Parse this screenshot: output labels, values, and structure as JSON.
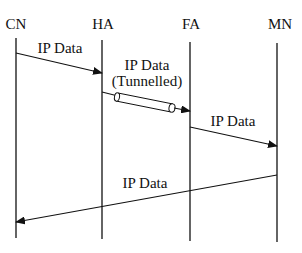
{
  "diagram": {
    "type": "sequence",
    "participants": [
      {
        "id": "CN",
        "label": "CN"
      },
      {
        "id": "HA",
        "label": "HA"
      },
      {
        "id": "FA",
        "label": "FA"
      },
      {
        "id": "MN",
        "label": "MN"
      }
    ],
    "messages": [
      {
        "from": "CN",
        "to": "HA",
        "label": "IP Data"
      },
      {
        "from": "HA",
        "to": "FA",
        "label_line1": "IP Data",
        "label_line2": "(Tunnelled)",
        "style": "tunnel"
      },
      {
        "from": "FA",
        "to": "MN",
        "label": "IP Data"
      },
      {
        "from": "MN",
        "to": "CN",
        "label": "IP Data"
      }
    ]
  }
}
